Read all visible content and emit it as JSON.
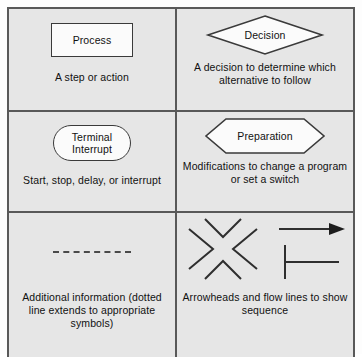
{
  "diagram": {
    "columns": 2,
    "rows": 3,
    "background_color": "#e6e6e6",
    "border_color": "#595959",
    "shape_fill_color": "#fbfbfb",
    "shape_stroke_color": "#3a3a3a",
    "text_color": "#111111"
  },
  "cells": [
    {
      "symbol": "rectangle",
      "symbol_name": "process-symbol",
      "label": "Process",
      "caption": "A step or action"
    },
    {
      "symbol": "diamond",
      "symbol_name": "decision-symbol",
      "label": "Decision",
      "caption": "A decision to determine\nwhich alternative\nto follow"
    },
    {
      "symbol": "stadium",
      "symbol_name": "terminal-interrupt-symbol",
      "label": "Terminal\nInterrupt",
      "caption": "Start, stop, delay, or interrupt"
    },
    {
      "symbol": "hexagon",
      "symbol_name": "preparation-symbol",
      "label": "Preparation",
      "caption": "Modifications to\nchange a program or\nset a switch"
    },
    {
      "symbol": "dashed-line",
      "symbol_name": "dotted-line-symbol",
      "label": "",
      "caption": "Additional information\n(dotted line extends to\nappropriate symbols)"
    },
    {
      "symbol": "arrowheads-and-flow-lines",
      "symbol_name": "arrowheads-flowlines-symbol",
      "label": "",
      "caption": "Arrowheads and\nflow lines to\nshow sequence"
    }
  ]
}
